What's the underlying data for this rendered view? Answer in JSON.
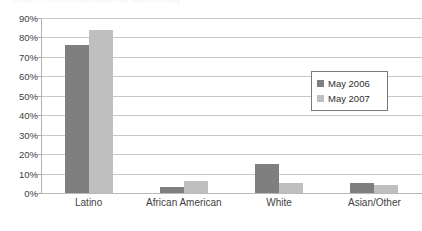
{
  "title_sliver": "Chart 1. Percent distribution by race/ethnicity",
  "legend": {
    "position": "inside-right",
    "entries": [
      {
        "label": "May 2006",
        "color": "#7f7f7f",
        "swatch_icon": "legend-swatch-icon"
      },
      {
        "label": "May 2007",
        "color": "#bfbfbf",
        "swatch_icon": "legend-swatch-icon"
      }
    ]
  },
  "chart_data": {
    "type": "bar",
    "title": "",
    "xlabel": "",
    "ylabel": "",
    "ylim": [
      0,
      90
    ],
    "ytick_step": 10,
    "ytick_labels": [
      "90%",
      "80%",
      "70%",
      "60%",
      "50%",
      "40%",
      "30%",
      "20%",
      "10%",
      "0%"
    ],
    "ytick_values": [
      90,
      80,
      70,
      60,
      50,
      40,
      30,
      20,
      10,
      0
    ],
    "grid": true,
    "grid_axis": "y",
    "legend_position": "inside-right",
    "categories": [
      "Latino",
      "African American",
      "White",
      "Asian/Other"
    ],
    "series": [
      {
        "name": "May 2006",
        "color": "#7f7f7f",
        "values": [
          76,
          3,
          15,
          5
        ]
      },
      {
        "name": "May 2007",
        "color": "#bfbfbf",
        "values": [
          84,
          6,
          5,
          4
        ]
      }
    ]
  }
}
